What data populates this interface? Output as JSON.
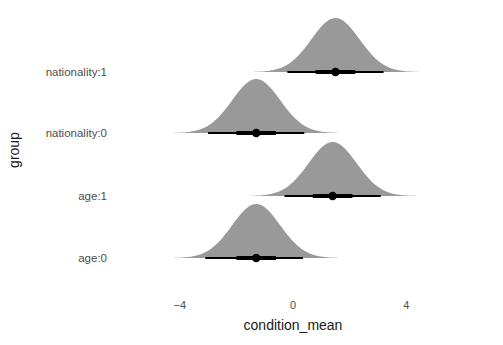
{
  "chart_data": {
    "type": "halfeye",
    "title": "",
    "xlabel": "condition_mean",
    "ylabel": "group",
    "xticks": [
      -4,
      0,
      4
    ],
    "xlim": [
      -6.5,
      7.5
    ],
    "grid": false,
    "categories": [
      "nationality:1",
      "nationality:0",
      "age:1",
      "age:0"
    ],
    "series": [
      {
        "name": "nationality:1",
        "point": 1.5,
        "sd": 0.85,
        "interval_66": [
          0.8,
          2.2
        ],
        "interval_95": [
          -0.2,
          3.2
        ],
        "tail": [
          -3.5,
          6.3
        ]
      },
      {
        "name": "nationality:0",
        "point": -1.3,
        "sd": 0.85,
        "interval_66": [
          -2.0,
          -0.6
        ],
        "interval_95": [
          -3.0,
          0.4
        ],
        "tail": [
          -6.3,
          3.3
        ]
      },
      {
        "name": "age:1",
        "point": 1.4,
        "sd": 0.85,
        "interval_66": [
          0.7,
          2.1
        ],
        "interval_95": [
          -0.3,
          3.1
        ],
        "tail": [
          -3.6,
          6.2
        ]
      },
      {
        "name": "age:0",
        "point": -1.3,
        "sd": 0.85,
        "interval_66": [
          -2.0,
          -0.6
        ],
        "interval_95": [
          -3.1,
          0.35
        ],
        "tail": [
          -6.3,
          4.2
        ]
      }
    ],
    "colors": {
      "density": "#999999",
      "interval": "#000000"
    }
  }
}
